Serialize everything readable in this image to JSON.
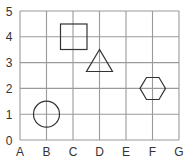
{
  "diagram": {
    "type": "coordinate-grid",
    "x_labels": [
      "A",
      "B",
      "C",
      "D",
      "E",
      "F",
      "G"
    ],
    "y_labels": [
      "0",
      "1",
      "2",
      "3",
      "4",
      "5"
    ],
    "colors": {
      "grid": "#9a9a9a",
      "shape": "#333333",
      "label": "#333333"
    },
    "shapes": [
      {
        "name": "circle",
        "position": "B1"
      },
      {
        "name": "square",
        "position": "C4"
      },
      {
        "name": "triangle",
        "position": "D3"
      },
      {
        "name": "hexagon",
        "position": "F2"
      }
    ]
  }
}
